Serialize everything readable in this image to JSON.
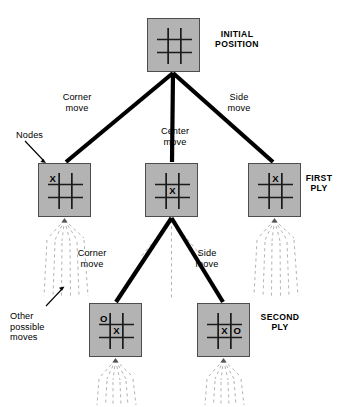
{
  "diagram": {
    "background_color": "#ffffff",
    "node_fill_color": "#b3b3b3",
    "node_border_color": "#4d4d4d",
    "edge_color": "#000000",
    "dashed_color": "#b0b0b0",
    "grid_color": "#1a1a1a"
  },
  "levels": [
    {
      "id": "root",
      "label": "INITIAL\nPOSITION"
    },
    {
      "id": "ply1",
      "label": "FIRST\nPLY"
    },
    {
      "id": "ply2",
      "label": "SECOND\nPLY"
    }
  ],
  "annotations": {
    "nodes_label": "Nodes",
    "other_moves_label": "Other\npossible\nmoves"
  },
  "edges": [
    {
      "id": "root-left",
      "label": "Corner\nmove"
    },
    {
      "id": "root-center",
      "label": "Center\nmove"
    },
    {
      "id": "root-right",
      "label": "Side\nmove"
    },
    {
      "id": "ply1-left",
      "label": "Corner\nmove"
    },
    {
      "id": "ply1-right",
      "label": "Side\nmove"
    }
  ],
  "nodes": [
    {
      "id": "root",
      "name": "initial-position",
      "x": 147,
      "y": 18,
      "w": 53,
      "h": 54,
      "marks": []
    },
    {
      "id": "ply1-corner",
      "name": "first-ply-corner",
      "x": 38,
      "y": 163,
      "w": 53,
      "h": 54,
      "marks": [
        {
          "cell": "top-left",
          "symbol": "X"
        }
      ]
    },
    {
      "id": "ply1-center",
      "name": "first-ply-center",
      "x": 145,
      "y": 163,
      "w": 53,
      "h": 54,
      "marks": [
        {
          "cell": "middle-center",
          "symbol": "X"
        }
      ]
    },
    {
      "id": "ply1-side",
      "name": "first-ply-side",
      "x": 248,
      "y": 163,
      "w": 53,
      "h": 54,
      "marks": [
        {
          "cell": "top-center",
          "symbol": "X"
        }
      ]
    },
    {
      "id": "ply2-corner",
      "name": "second-ply-corner",
      "x": 89,
      "y": 303,
      "w": 53,
      "h": 54,
      "marks": [
        {
          "cell": "top-left",
          "symbol": "O"
        },
        {
          "cell": "middle-center",
          "symbol": "X"
        }
      ]
    },
    {
      "id": "ply2-side",
      "name": "second-ply-side",
      "x": 197,
      "y": 303,
      "w": 53,
      "h": 54,
      "marks": [
        {
          "cell": "middle-center",
          "symbol": "X"
        },
        {
          "cell": "middle-right",
          "symbol": "O"
        }
      ]
    }
  ],
  "text_positions": {
    "initial_position": {
      "x": 207,
      "y": 32
    },
    "first_ply": {
      "x": 303,
      "y": 175
    },
    "second_ply": {
      "x": 256,
      "y": 314
    },
    "corner_move_1": {
      "x": 72,
      "y": 93
    },
    "center_move_1": {
      "x": 170,
      "y": 127
    },
    "side_move_1": {
      "x": 238,
      "y": 93
    },
    "corner_move_2": {
      "x": 90,
      "y": 249
    },
    "side_move_2": {
      "x": 188,
      "y": 249
    },
    "nodes": {
      "x": 17,
      "y": 131
    },
    "other_moves": {
      "x": 10,
      "y": 313
    }
  }
}
